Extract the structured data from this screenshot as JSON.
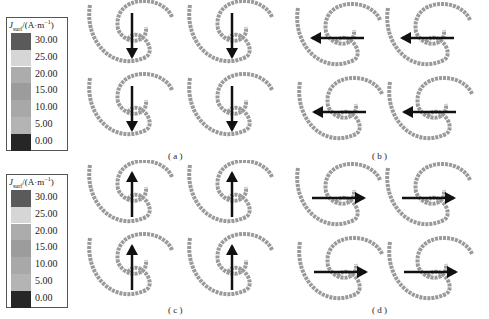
{
  "legends": [
    {
      "title_var": "J",
      "title_sub": "surf",
      "title_unit": "/(A·m",
      "title_sup": "−1",
      "title_close": ")",
      "labels": [
        "30.00",
        "25.00",
        "20.00",
        "15.00",
        "10.00",
        "5.00",
        "0.00"
      ],
      "colors": [
        "#5a5a5a",
        "#d6d6d6",
        "#acacac",
        "#9c9c9c",
        "#a8a8a8",
        "#b4b4b4",
        "#262626"
      ]
    },
    {
      "title_var": "J",
      "title_sub": "surf",
      "title_unit": "/(A·m",
      "title_sup": "−1",
      "title_close": ")",
      "labels": [
        "30.00",
        "25.00",
        "20.00",
        "15.00",
        "10.00",
        "5.00",
        "0.00"
      ],
      "colors": [
        "#5a5a5a",
        "#d6d6d6",
        "#acacac",
        "#9c9c9c",
        "#a8a8a8",
        "#b4b4b4",
        "#262626"
      ]
    }
  ],
  "panels": [
    {
      "id": "a",
      "caption": "( a )",
      "arrow_direction": "down"
    },
    {
      "id": "b",
      "caption": "( b )",
      "arrow_direction": "left"
    },
    {
      "id": "c",
      "caption": "( c )",
      "arrow_direction": "up"
    },
    {
      "id": "d",
      "caption": "( d )",
      "arrow_direction": "right"
    }
  ],
  "colors": {
    "spiral": "#9a9a9a",
    "arrow": "#111111"
  }
}
